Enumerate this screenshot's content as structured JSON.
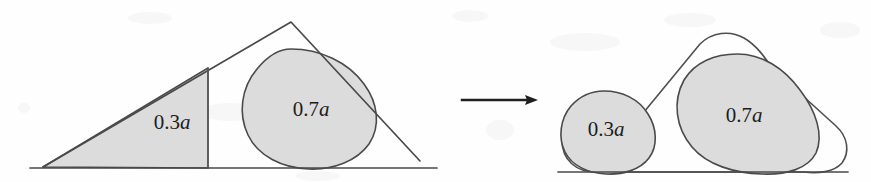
{
  "figure": {
    "background_color": "#fefefe",
    "shade_color": "#dcdcdc",
    "stroke_color": "#4a4a4a",
    "text_color": "#1c1c1c",
    "width": 871,
    "height": 182
  },
  "left_panel": {
    "name": "triangle-with-inscribed-blob",
    "baseline": {
      "x1": 30,
      "y1": 168,
      "x2": 437,
      "y2": 168
    },
    "triangle": {
      "apex": {
        "x": 291,
        "y": 22
      },
      "left_vertex": {
        "x": 43,
        "y": 167
      },
      "right_vertex": {
        "x": 420,
        "y": 161
      }
    },
    "divider": {
      "x": 208,
      "y_top": 68,
      "y_bottom": 168
    },
    "shaded_region_label": "0.3a",
    "blob_label": "0.7a",
    "shaded_label_pos": {
      "x": 172,
      "y": 124
    },
    "blob_label_pos": {
      "x": 311,
      "y": 111
    }
  },
  "arrow": {
    "name": "transformation-arrow",
    "glyph": "→",
    "x_start": 462,
    "x_end": 538,
    "y": 100
  },
  "right_panel": {
    "name": "two-blobs-in-rounded-envelope",
    "baseline": {
      "x1": 558,
      "y1": 172,
      "x2": 848,
      "y2": 172
    },
    "small_blob_label": "0.3a",
    "large_blob_label": "0.7a",
    "small_blob_label_pos": {
      "x": 604,
      "y": 131
    },
    "large_blob_label_pos": {
      "x": 741,
      "y": 117
    },
    "envelope_apex": {
      "x": 731,
      "y": 35
    }
  },
  "labels": {
    "small_fraction": "0.3a",
    "large_fraction": "0.7a",
    "small_fraction_number": "0.3",
    "large_fraction_number": "0.7",
    "variable": "a"
  }
}
